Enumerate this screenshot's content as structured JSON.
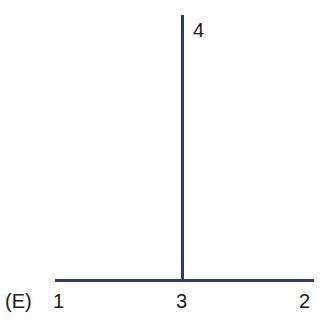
{
  "figure": {
    "panel_label": "(E)",
    "line_color": "#2b3a7c",
    "nodes": [
      {
        "id": "1",
        "label": "1"
      },
      {
        "id": "2",
        "label": "2"
      },
      {
        "id": "3",
        "label": "3"
      },
      {
        "id": "4",
        "label": "4"
      }
    ],
    "edges": [
      {
        "from": "1",
        "to": "2",
        "orientation": "horizontal"
      },
      {
        "from": "3",
        "to": "4",
        "orientation": "vertical"
      }
    ]
  }
}
